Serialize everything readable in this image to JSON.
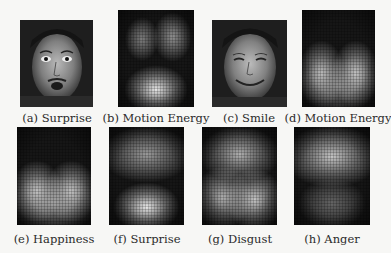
{
  "figure": {
    "row1": [
      {
        "id": "a",
        "caption": "(a) Surprise",
        "kind": "face",
        "expression": "surprise"
      },
      {
        "id": "b",
        "caption": "(b) Motion Energy",
        "kind": "heatmap",
        "blobs": [
          {
            "x": 32,
            "y": 30,
            "rx": 14,
            "ry": 14,
            "intensity": 0.45
          },
          {
            "x": 72,
            "y": 28,
            "rx": 16,
            "ry": 16,
            "intensity": 0.55
          },
          {
            "x": 50,
            "y": 82,
            "rx": 26,
            "ry": 16,
            "intensity": 0.95
          }
        ]
      },
      {
        "id": "c",
        "caption": "(c) Smile",
        "kind": "face",
        "expression": "smile"
      },
      {
        "id": "d",
        "caption": "(d) Motion Energy",
        "kind": "heatmap",
        "blobs": [
          {
            "x": 27,
            "y": 66,
            "rx": 20,
            "ry": 22,
            "intensity": 0.8
          },
          {
            "x": 73,
            "y": 66,
            "rx": 20,
            "ry": 22,
            "intensity": 0.85
          },
          {
            "x": 50,
            "y": 78,
            "rx": 35,
            "ry": 18,
            "intensity": 0.45
          }
        ]
      }
    ],
    "row2": [
      {
        "id": "e",
        "caption": "(e) Happiness",
        "kind": "heatmap",
        "blobs": [
          {
            "x": 27,
            "y": 66,
            "rx": 22,
            "ry": 20,
            "intensity": 0.8
          },
          {
            "x": 73,
            "y": 66,
            "rx": 22,
            "ry": 20,
            "intensity": 0.8
          },
          {
            "x": 50,
            "y": 78,
            "rx": 38,
            "ry": 18,
            "intensity": 0.55
          }
        ]
      },
      {
        "id": "f",
        "caption": "(f) Surprise",
        "kind": "heatmap",
        "blobs": [
          {
            "x": 50,
            "y": 28,
            "rx": 38,
            "ry": 18,
            "intensity": 0.6
          },
          {
            "x": 50,
            "y": 82,
            "rx": 28,
            "ry": 16,
            "intensity": 0.95
          }
        ]
      },
      {
        "id": "g",
        "caption": "(g) Disgust",
        "kind": "heatmap",
        "blobs": [
          {
            "x": 50,
            "y": 28,
            "rx": 34,
            "ry": 18,
            "intensity": 0.7
          },
          {
            "x": 28,
            "y": 72,
            "rx": 24,
            "ry": 20,
            "intensity": 0.7
          },
          {
            "x": 70,
            "y": 74,
            "rx": 24,
            "ry": 20,
            "intensity": 0.8
          }
        ]
      },
      {
        "id": "h",
        "caption": "(h) Anger",
        "kind": "heatmap",
        "blobs": [
          {
            "x": 50,
            "y": 30,
            "rx": 40,
            "ry": 20,
            "intensity": 0.8
          },
          {
            "x": 50,
            "y": 78,
            "rx": 28,
            "ry": 16,
            "intensity": 0.3
          }
        ]
      }
    ]
  }
}
